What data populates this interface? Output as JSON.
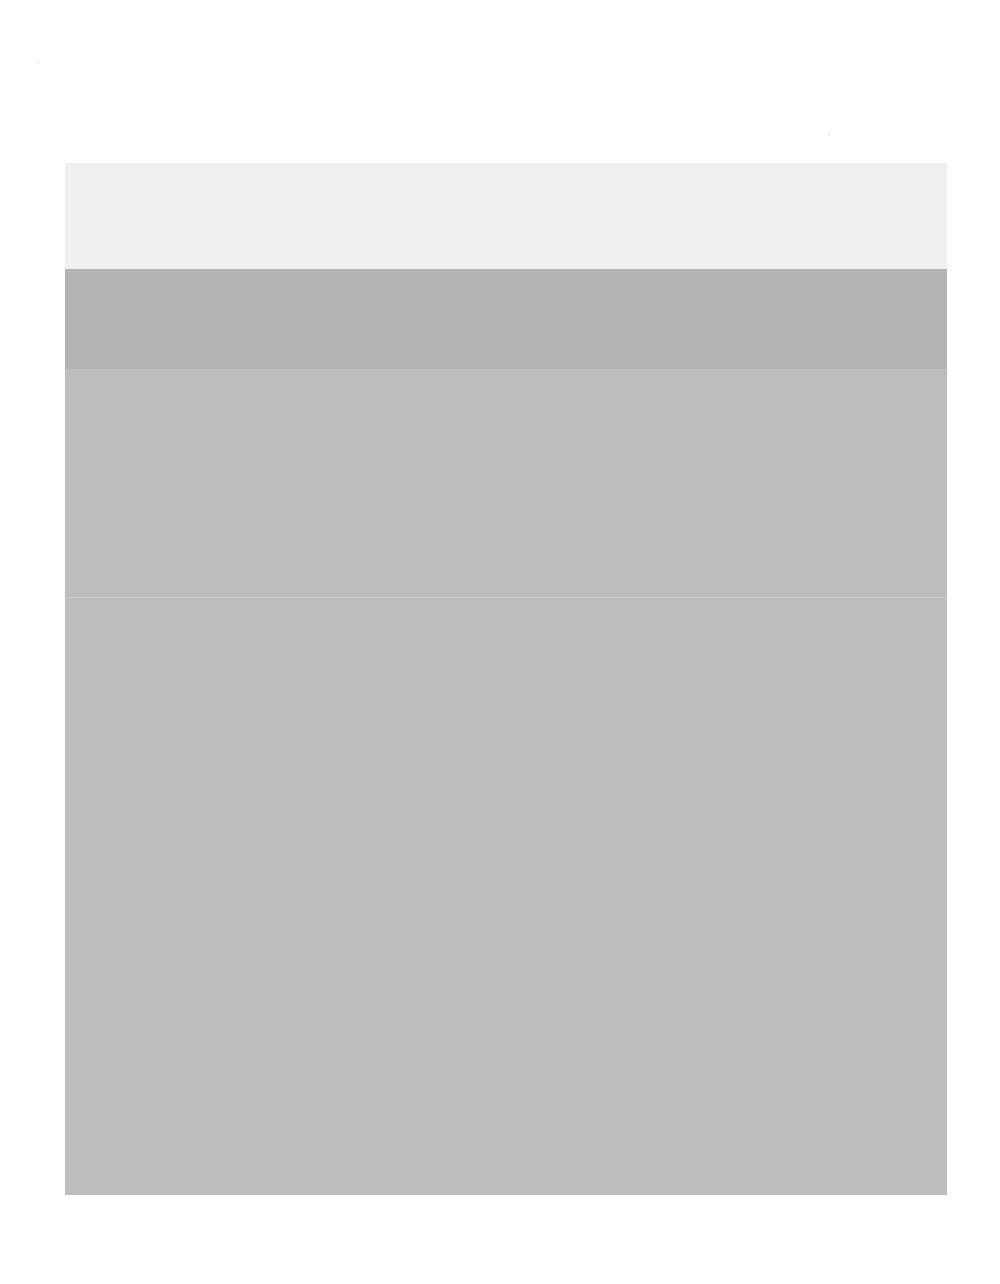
{
  "page": {
    "background_color": "#ffffff",
    "width": 1000,
    "height": 1284,
    "state": "blank"
  },
  "window": {
    "title": "",
    "x": 65,
    "y": 163,
    "width": 882,
    "height": 1032,
    "background_color": "#bdbdbd",
    "titlebar": {
      "background_color": "#f0f0f0",
      "height": 106,
      "title_text": "",
      "controls": [
        {
          "name": "minimize",
          "label": ""
        },
        {
          "name": "maximize",
          "label": ""
        },
        {
          "name": "close",
          "label": ""
        }
      ]
    },
    "toolbar": {
      "background_color": "#b4b4b4",
      "height": 100,
      "label": "",
      "items": []
    },
    "body": {
      "background_color": "#bdbdbd",
      "divider_color": "#cfcfcf",
      "divider_offset": 228,
      "placeholder_text": "",
      "content": []
    }
  },
  "artifacts": {
    "speck_left": {
      "color": "#f4f4f4"
    },
    "speck_right": {
      "color": "#f2f2f2"
    }
  }
}
